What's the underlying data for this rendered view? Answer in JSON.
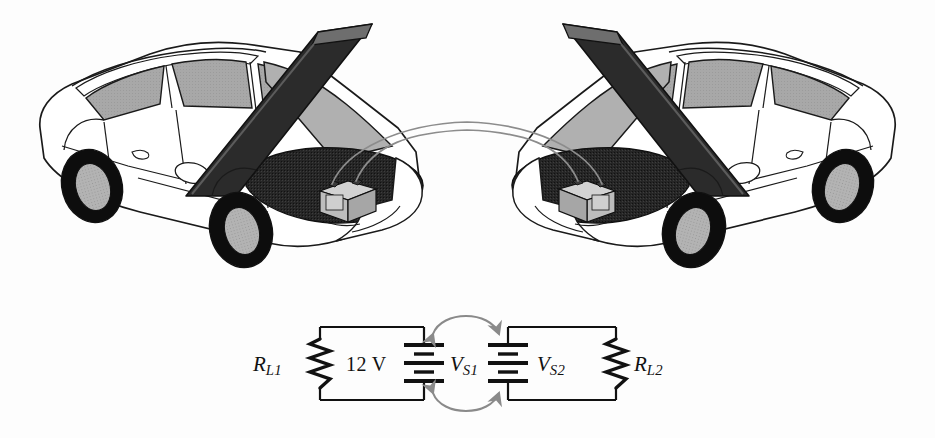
{
  "figure": {
    "background_color": "#fdfdfd"
  },
  "illustration": {
    "left_car": {
      "name": "left-car",
      "description": "Three-quarter view sedan facing right with hood raised, engine bay exposed, battery visible",
      "body_color": "#ffffff",
      "outline_color": "#1a1a1a",
      "window_color": "#a8a8a8",
      "hood_color": "#2b2b2b",
      "hood_edge_color": "#6e6e6e",
      "engine_bay_color": "#262626",
      "tire_color": "#0d0d0d",
      "hubcap_color": "#b3b3b3",
      "battery_color": "#c6c6c6"
    },
    "right_car": {
      "name": "right-car",
      "description": "Mirrored three-quarter view sedan facing left with hood raised, engine bay exposed, battery visible",
      "body_color": "#ffffff",
      "outline_color": "#1a1a1a",
      "window_color": "#a8a8a8",
      "hood_color": "#2b2b2b",
      "hood_edge_color": "#6e6e6e",
      "engine_bay_color": "#262626",
      "tire_color": "#0d0d0d",
      "hubcap_color": "#b3b3b3",
      "battery_color": "#c6c6c6"
    },
    "jumper_cables": {
      "name": "jumper-cables",
      "count": 2,
      "color": "#8c8c8c",
      "description": "Two thin cables arcing from the left car battery terminals to the right car battery terminals"
    }
  },
  "circuit": {
    "line_color": "#111111",
    "arrow_color": "#8a8a8a",
    "left_loop": {
      "resistor_label_main": "R",
      "resistor_label_sub": "L1",
      "source_value": "12 V",
      "source_label_main": "V",
      "source_label_sub": "S1"
    },
    "right_loop": {
      "resistor_label_main": "R",
      "resistor_label_sub": "L2",
      "source_label_main": "V",
      "source_label_sub": "S2"
    },
    "coupling_arrows": {
      "top": "double-headed arc curving upward between the two sources",
      "bottom": "double-headed arc curving downward between the two sources"
    }
  }
}
